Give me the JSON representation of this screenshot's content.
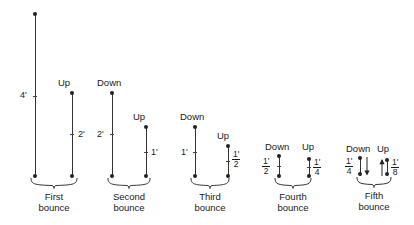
{
  "figure": {
    "type": "diagram",
    "stroke_color": "#333333",
    "text_color": "#1a1a1a",
    "background": "#ffffff"
  },
  "labels": {
    "down": "Down",
    "up": "Up"
  },
  "bounces": [
    {
      "id": "first",
      "caption_line1": "First",
      "caption_line2": "bounce",
      "down": {
        "label": "",
        "height_label": "4'",
        "height_value": 4
      },
      "up": {
        "label": "Up",
        "height_label": "2'",
        "height_value": 2
      }
    },
    {
      "id": "second",
      "caption_line1": "Second",
      "caption_line2": "bounce",
      "down": {
        "label": "Down",
        "height_label": "2'",
        "height_value": 2
      },
      "up": {
        "label": "Up",
        "height_label": "1'",
        "height_value": 1
      }
    },
    {
      "id": "third",
      "caption_line1": "Third",
      "caption_line2": "bounce",
      "down": {
        "label": "Down",
        "height_label": "1'",
        "height_value": 1
      },
      "up": {
        "label": "Up",
        "height_num": "1'",
        "height_den": "2",
        "height_value": 0.5
      }
    },
    {
      "id": "fourth",
      "caption_line1": "Fourth",
      "caption_line2": "bounce",
      "down": {
        "label": "Down",
        "height_num": "1'",
        "height_den": "2",
        "height_value": 0.5
      },
      "up": {
        "label": "Up",
        "height_num": "1'",
        "height_den": "4",
        "height_value": 0.25
      }
    },
    {
      "id": "fifth",
      "caption_line1": "Fifth",
      "caption_line2": "bounce",
      "down": {
        "label": "Down",
        "height_num": "1'",
        "height_den": "4",
        "height_value": 0.25
      },
      "up": {
        "label": "Up",
        "height_num": "1'",
        "height_den": "8",
        "height_value": 0.125
      }
    }
  ]
}
